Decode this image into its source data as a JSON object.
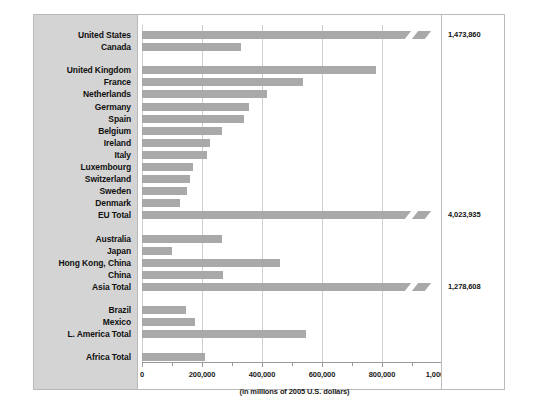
{
  "chart_data": {
    "type": "bar",
    "orientation": "horizontal",
    "title": "",
    "subtitle": "(in millions of 2005 U.S. dollars)",
    "xlabel": "(in millions of 2005 U.S. dollars)",
    "ylabel": "",
    "xlim": [
      0,
      1000000
    ],
    "xticks": [
      0,
      200000,
      400000,
      600000,
      800000,
      1000000
    ],
    "xtick_labels": [
      "0",
      "200,000",
      "400,000",
      "600,000",
      "800,000",
      "1,000,000"
    ],
    "grid": true,
    "legend": "none",
    "categories": [
      "United States",
      "Canada",
      "United Kingdom",
      "France",
      "Netherlands",
      "Germany",
      "Spain",
      "Belgium",
      "Ireland",
      "Italy",
      "Luxembourg",
      "Switzerland",
      "Sweden",
      "Denmark",
      "EU Total",
      "Australia",
      "Japan",
      "Hong Kong, China",
      "China",
      "Asia Total",
      "Brazil",
      "Mexico",
      "L. America Total",
      "Africa Total"
    ],
    "values": [
      1473860,
      330000,
      780000,
      535000,
      415000,
      355000,
      340000,
      265000,
      225000,
      215000,
      170000,
      160000,
      150000,
      125000,
      4023935,
      267000,
      100000,
      460000,
      270000,
      1278608,
      148000,
      175000,
      545000,
      210000
    ],
    "value_labels": [
      {
        "category": "United States",
        "text": "1,473,860"
      },
      {
        "category": "EU Total",
        "text": "4,023,935"
      },
      {
        "category": "Asia Total",
        "text": "1,278,608"
      }
    ],
    "broken_bars": [
      "United States",
      "EU Total",
      "Asia Total"
    ],
    "group_gaps_after": [
      "Canada",
      "EU Total",
      "Asia Total",
      "L. America Total"
    ],
    "colors": {
      "bar": "#a9a9a9",
      "gridline": "#cfcfcf",
      "axis": "#9a9a9a",
      "label_panel_bg": "#d4d4d4",
      "plot_bg": "#ffffff",
      "frame_border": "#b9b9b9",
      "text": "#111111"
    }
  }
}
